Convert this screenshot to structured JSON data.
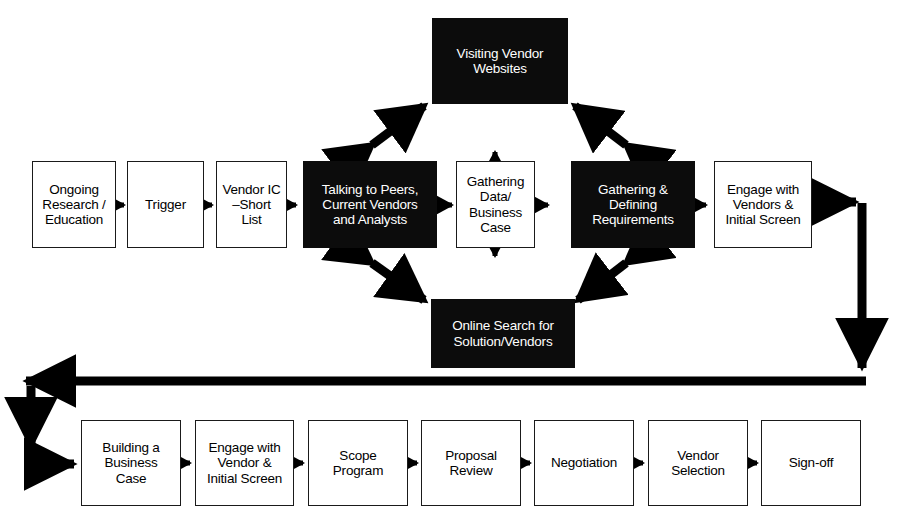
{
  "diagram": {
    "background_color": "#ffffff",
    "box_fill_white": "#ffffff",
    "box_fill_black": "#0c0c0c",
    "line_color": "#000000",
    "nodes": [
      {
        "id": "visiting-vendor-websites",
        "label": "Visiting Vendor\nWebsites",
        "style": "black",
        "x": 432,
        "y": 18,
        "w": 136,
        "h": 86
      },
      {
        "id": "ongoing-research-education",
        "label": "Ongoing\nResearch /\nEducation",
        "style": "white",
        "x": 32,
        "y": 161,
        "w": 84,
        "h": 87
      },
      {
        "id": "trigger",
        "label": "Trigger",
        "style": "white",
        "x": 127,
        "y": 161,
        "w": 77,
        "h": 87
      },
      {
        "id": "vendor-ic-short-list",
        "label": "Vendor IC\n–Short\nList",
        "style": "white",
        "x": 216,
        "y": 161,
        "w": 71,
        "h": 87
      },
      {
        "id": "talking-to-peers",
        "label": "Talking to Peers,\nCurrent Vendors\nand Analysts",
        "style": "black",
        "x": 303,
        "y": 161,
        "w": 134,
        "h": 87
      },
      {
        "id": "gathering-data-business-case",
        "label": "Gathering\nData/\nBusiness\nCase",
        "style": "white",
        "x": 456,
        "y": 161,
        "w": 79,
        "h": 87
      },
      {
        "id": "gathering-defining-requirements",
        "label": "Gathering &\nDefining\nRequirements",
        "style": "black",
        "x": 571,
        "y": 161,
        "w": 124,
        "h": 87
      },
      {
        "id": "engage-with-vendors-initial-screen",
        "label": "Engage with\nVendors &\nInitial Screen",
        "style": "white",
        "x": 714,
        "y": 161,
        "w": 98,
        "h": 87
      },
      {
        "id": "online-search-for-solution-vendors",
        "label": "Online Search for\nSolution/Vendors",
        "style": "black",
        "x": 431,
        "y": 299,
        "w": 144,
        "h": 69
      },
      {
        "id": "building-a-business-case",
        "label": "Building a\nBusiness\nCase",
        "style": "white",
        "x": 81,
        "y": 420,
        "w": 100,
        "h": 86
      },
      {
        "id": "engage-with-vendor-initial-screen",
        "label": "Engage with\nVendor &\nInitial Screen",
        "style": "white",
        "x": 195,
        "y": 420,
        "w": 99,
        "h": 86
      },
      {
        "id": "scope-program",
        "label": "Scope\nProgram",
        "style": "white",
        "x": 308,
        "y": 420,
        "w": 100,
        "h": 86
      },
      {
        "id": "proposal-review",
        "label": "Proposal\nReview",
        "style": "white",
        "x": 421,
        "y": 420,
        "w": 100,
        "h": 86
      },
      {
        "id": "negotiation",
        "label": "Negotiation",
        "style": "white",
        "x": 534,
        "y": 420,
        "w": 100,
        "h": 86
      },
      {
        "id": "vendor-selection",
        "label": "Vendor\nSelection",
        "style": "white",
        "x": 648,
        "y": 420,
        "w": 100,
        "h": 86
      },
      {
        "id": "sign-off",
        "label": "Sign-off",
        "style": "white",
        "x": 761,
        "y": 420,
        "w": 100,
        "h": 86
      }
    ],
    "connectors": [
      {
        "id": "ongoing-to-trigger",
        "kind": "arrow-right-small"
      },
      {
        "id": "trigger-to-vendor-ic",
        "kind": "arrow-right-small"
      },
      {
        "id": "vendor-ic-to-talking-to-peers",
        "kind": "arrow-right-small"
      },
      {
        "id": "talking-to-peers-to-gathering-data",
        "kind": "arrow-double-horizontal"
      },
      {
        "id": "gathering-data-to-requirements",
        "kind": "arrow-double-horizontal"
      },
      {
        "id": "gathering-data-to-visiting-websites",
        "kind": "arrow-double-vertical-up"
      },
      {
        "id": "gathering-data-to-online-search",
        "kind": "arrow-double-vertical-down"
      },
      {
        "id": "talking-to-peers-to-visiting-websites",
        "kind": "arrow-double-diagonal"
      },
      {
        "id": "requirements-to-visiting-websites",
        "kind": "arrow-double-diagonal"
      },
      {
        "id": "talking-to-peers-to-online-search",
        "kind": "arrow-double-diagonal"
      },
      {
        "id": "requirements-to-online-search",
        "kind": "arrow-double-diagonal"
      },
      {
        "id": "requirements-to-engage-vendors",
        "kind": "arrow-right-small"
      },
      {
        "id": "engage-vendors-to-bottom-row",
        "kind": "arrow-route-right-down-left"
      },
      {
        "id": "bottom-route-to-building-business-case",
        "kind": "arrow-route-down-right"
      },
      {
        "id": "building-to-engage-vendor",
        "kind": "arrow-right-small"
      },
      {
        "id": "engage-vendor-to-scope",
        "kind": "arrow-right-small"
      },
      {
        "id": "scope-to-proposal",
        "kind": "arrow-right-small"
      },
      {
        "id": "proposal-to-negotiation",
        "kind": "arrow-right-small"
      },
      {
        "id": "negotiation-to-vendor-selection",
        "kind": "arrow-right-small"
      },
      {
        "id": "vendor-selection-to-sign-off",
        "kind": "arrow-right-small"
      }
    ]
  }
}
